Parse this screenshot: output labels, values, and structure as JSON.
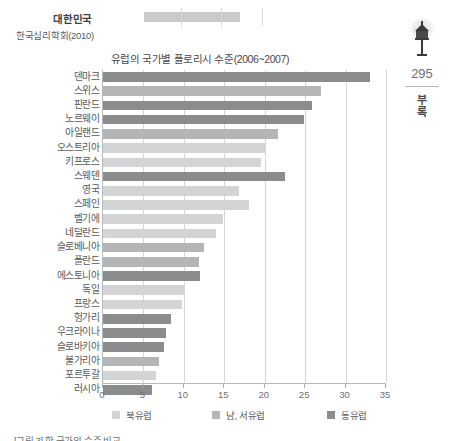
{
  "top_bleed": {
    "label": "대한민국",
    "source": "한국심리학회(2010)"
  },
  "chart_title": "유럽의 국가별 플로리시 수준(2006~2007)",
  "bottom_caption": "[그림 3] 한 국가의 수준 비교",
  "page_margin": {
    "icon": "lamp-icon",
    "page_number": "295",
    "section_char_1": "부",
    "section_char_2": "록"
  },
  "legend": {
    "items": [
      {
        "label": "북유럽",
        "color": "#d3d4d5"
      },
      {
        "label": "남, 서유럽",
        "color": "#b4b5b6"
      },
      {
        "label": "동유럽",
        "color": "#8b8c8e"
      }
    ]
  },
  "chart_data": {
    "type": "bar",
    "orientation": "horizontal",
    "title": "유럽의 국가별 플로리시 수준(2006~2007)",
    "xlabel": "",
    "ylabel": "",
    "xlim": [
      0,
      35
    ],
    "xticks": [
      0,
      5,
      10,
      15,
      20,
      25,
      30,
      35
    ],
    "grid": true,
    "legend_position": "bottom",
    "categories": [
      "덴마크",
      "스위스",
      "핀란드",
      "노르웨이",
      "아일랜드",
      "오스트리아",
      "키프로스",
      "스웨덴",
      "영국",
      "스페인",
      "벨기에",
      "네덜란드",
      "슬로베니아",
      "폴란드",
      "에스토니아",
      "독일",
      "프랑스",
      "헝가리",
      "우크라이나",
      "슬로바키아",
      "불가리아",
      "포르투갈",
      "러시아"
    ],
    "values": [
      33.0,
      27.0,
      25.8,
      24.9,
      21.6,
      20.0,
      19.6,
      22.5,
      16.8,
      18.0,
      14.8,
      14.0,
      12.5,
      11.9,
      12.0,
      10.0,
      9.8,
      8.4,
      7.8,
      7.5,
      6.9,
      6.5,
      6.0
    ],
    "groups": [
      "동유럽",
      "남, 서유럽",
      "동유럽",
      "동유럽",
      "남, 서유럽",
      "북유럽",
      "북유럽",
      "동유럽",
      "북유럽",
      "북유럽",
      "북유럽",
      "북유럽",
      "남, 서유럽",
      "남, 서유럽",
      "동유럽",
      "북유럽",
      "북유럽",
      "동유럽",
      "동유럽",
      "동유럽",
      "남, 서유럽",
      "북유럽",
      "동유럽"
    ],
    "group_colors": {
      "북유럽": "#d3d4d5",
      "남, 서유럽": "#b4b5b6",
      "동유럽": "#8b8c8e"
    }
  }
}
